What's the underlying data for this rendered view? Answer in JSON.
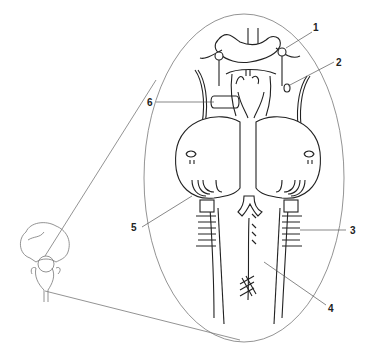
{
  "diagram": {
    "type": "anatomical-illustration",
    "labels": [
      {
        "id": "1",
        "text": "1"
      },
      {
        "id": "2",
        "text": "2"
      },
      {
        "id": "3",
        "text": "3"
      },
      {
        "id": "4",
        "text": "4"
      },
      {
        "id": "5",
        "text": "5"
      },
      {
        "id": "6",
        "text": "6"
      }
    ],
    "colors": {
      "ink": "#222222",
      "outline": "#777777",
      "background": "#ffffff"
    }
  }
}
